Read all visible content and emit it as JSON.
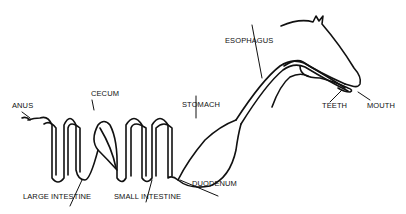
{
  "diagram": {
    "labels": {
      "anus": "ANUS",
      "cecum": "CECUM",
      "stomach": "STOMACH",
      "esophagus": "ESOPHAGUS",
      "teeth": "TEETH",
      "mouth": "MOUTH",
      "large_intestine": "LARGE INTESTINE",
      "small_intestine": "SMALL INTESTINE",
      "duodenum": "DUODENUM"
    },
    "colors": {
      "line": "#111111",
      "background": "#ffffff"
    }
  }
}
